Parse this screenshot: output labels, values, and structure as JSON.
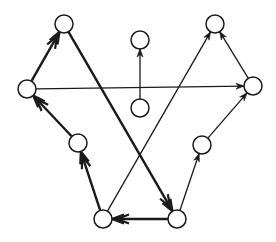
{
  "diagram": {
    "type": "directed-graph",
    "colors": {
      "stroke": "#1a1a1a",
      "node_fill": "#ffffff",
      "background": "#ffffff"
    },
    "node_radius": 9,
    "nodes": [
      {
        "id": "A",
        "x": 64,
        "y": 24
      },
      {
        "id": "B",
        "x": 140,
        "y": 40
      },
      {
        "id": "C",
        "x": 215,
        "y": 24
      },
      {
        "id": "D",
        "x": 27,
        "y": 89
      },
      {
        "id": "E",
        "x": 140,
        "y": 108
      },
      {
        "id": "F",
        "x": 253,
        "y": 86
      },
      {
        "id": "G",
        "x": 78,
        "y": 143
      },
      {
        "id": "H",
        "x": 202,
        "y": 145
      },
      {
        "id": "I",
        "x": 103,
        "y": 219
      },
      {
        "id": "J",
        "x": 177,
        "y": 219
      }
    ],
    "edges": [
      {
        "from": "D",
        "to": "A",
        "weight": "thick"
      },
      {
        "from": "A",
        "to": "J",
        "weight": "thick"
      },
      {
        "from": "J",
        "to": "I",
        "weight": "thick"
      },
      {
        "from": "I",
        "to": "G",
        "weight": "thick"
      },
      {
        "from": "G",
        "to": "D",
        "weight": "thick"
      },
      {
        "from": "D",
        "to": "F",
        "weight": "thin"
      },
      {
        "from": "E",
        "to": "B",
        "weight": "thin"
      },
      {
        "from": "I",
        "to": "C",
        "weight": "thin"
      },
      {
        "from": "F",
        "to": "C",
        "weight": "thin"
      },
      {
        "from": "J",
        "to": "H",
        "weight": "thin"
      },
      {
        "from": "H",
        "to": "F",
        "weight": "thin"
      }
    ]
  }
}
